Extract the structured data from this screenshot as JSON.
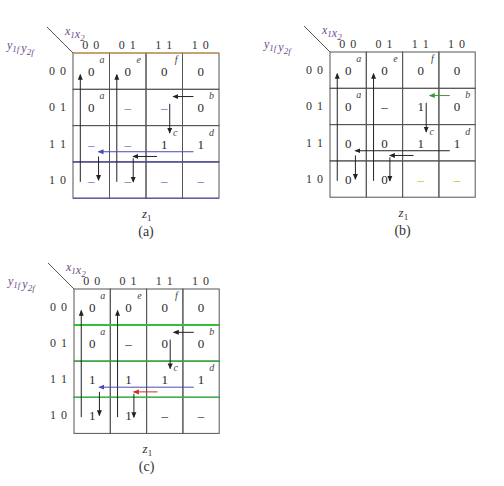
{
  "figure": {
    "maps": [
      {
        "id": "a",
        "caption": "(a)",
        "output_label": "z",
        "output_sub": "1",
        "col_var": {
          "v1": "x",
          "s1": "1",
          "v2": "x",
          "s2": "2"
        },
        "row_var": {
          "v1": "y",
          "s1": "1f",
          "v2": "y",
          "s2": "2f"
        },
        "col_headers": [
          "0 0",
          "0 1",
          "1 1",
          "1 0"
        ],
        "row_headers": [
          "0 0",
          "0 1",
          "1 1",
          "1 0"
        ],
        "cells": [
          [
            "0",
            "0",
            "0",
            "0"
          ],
          [
            "0",
            "–",
            "–",
            "0"
          ],
          [
            "–",
            "–",
            "1",
            "1"
          ],
          [
            "–",
            "–",
            "–",
            "–"
          ]
        ],
        "state_labels": [
          {
            "row": 0,
            "col": 0,
            "label": "a"
          },
          {
            "row": 0,
            "col": 1,
            "label": "e"
          },
          {
            "row": 0,
            "col": 2,
            "label": "f"
          },
          {
            "row": 1,
            "col": 0,
            "label": "a"
          },
          {
            "row": 1,
            "col": 3,
            "label": "b"
          },
          {
            "row": 2,
            "col": 2,
            "label": "c"
          },
          {
            "row": 2,
            "col": 3,
            "label": "d"
          }
        ]
      },
      {
        "id": "b",
        "caption": "(b)",
        "output_label": "z",
        "output_sub": "1",
        "col_var": {
          "v1": "x",
          "s1": "1",
          "v2": "x",
          "s2": "2"
        },
        "row_var": {
          "v1": "y",
          "s1": "1f",
          "v2": "y",
          "s2": "2f"
        },
        "col_headers": [
          "0 0",
          "0 1",
          "1 1",
          "1 0"
        ],
        "row_headers": [
          "0 0",
          "0 1",
          "1 1",
          "1 0"
        ],
        "cells": [
          [
            "0",
            "0",
            "0",
            "0"
          ],
          [
            "0",
            "–",
            "1",
            "0"
          ],
          [
            "0",
            "0",
            "1",
            "1"
          ],
          [
            "0",
            "0",
            "–",
            "–"
          ]
        ],
        "state_labels": [
          {
            "row": 0,
            "col": 0,
            "label": "a"
          },
          {
            "row": 0,
            "col": 1,
            "label": "e"
          },
          {
            "row": 0,
            "col": 2,
            "label": "f"
          },
          {
            "row": 1,
            "col": 0,
            "label": "a"
          },
          {
            "row": 1,
            "col": 3,
            "label": "b"
          },
          {
            "row": 2,
            "col": 2,
            "label": "c"
          },
          {
            "row": 2,
            "col": 3,
            "label": "d"
          }
        ]
      },
      {
        "id": "c",
        "caption": "(c)",
        "output_label": "z",
        "output_sub": "1",
        "col_var": {
          "v1": "x",
          "s1": "1",
          "v2": "x",
          "s2": "2"
        },
        "row_var": {
          "v1": "y",
          "s1": "1f",
          "v2": "y",
          "s2": "2f"
        },
        "col_headers": [
          "0 0",
          "0 1",
          "1 1",
          "1 0"
        ],
        "row_headers": [
          "0 0",
          "0 1",
          "1 1",
          "1 0"
        ],
        "cells": [
          [
            "0",
            "0",
            "0",
            "0"
          ],
          [
            "0",
            "–",
            "0",
            "0"
          ],
          [
            "1",
            "1",
            "1",
            "1"
          ],
          [
            "1",
            "1",
            "–",
            "–"
          ]
        ],
        "state_labels": [
          {
            "row": 0,
            "col": 0,
            "label": "a"
          },
          {
            "row": 0,
            "col": 1,
            "label": "e"
          },
          {
            "row": 0,
            "col": 2,
            "label": "f"
          },
          {
            "row": 1,
            "col": 0,
            "label": "a"
          },
          {
            "row": 1,
            "col": 3,
            "label": "b"
          },
          {
            "row": 2,
            "col": 2,
            "label": "c"
          },
          {
            "row": 2,
            "col": 3,
            "label": "d"
          }
        ]
      }
    ],
    "colors": {
      "grid": "#555555",
      "arrow": "#222222",
      "label_purple": "#6a4c8a",
      "dont_care_blue": "#5a64b4",
      "dont_care_yellow": "#c8b420",
      "blue_line": "#4a4ab8",
      "green_line": "#30c040",
      "green_arrow": "#3a9a3a",
      "red_arrow": "#d03020",
      "orange_border": "#d8a040"
    }
  }
}
